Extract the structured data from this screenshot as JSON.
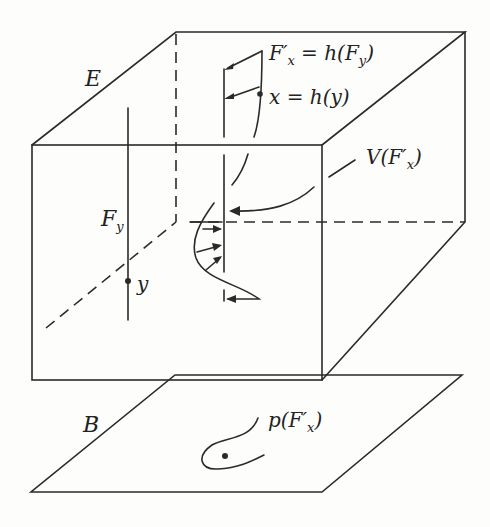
{
  "diagram": {
    "labels": {
      "total_space": "E",
      "base_space": "B",
      "fiber_y": "F",
      "fiber_y_sub": "y",
      "point_y": "y",
      "fiber_x_eq": "F′",
      "fiber_x_sub": "x",
      "fiber_x_rhs": " = h(F",
      "fiber_x_rhs_sub": "y",
      "fiber_x_rhs_close": ")",
      "point_x": "x = h(y)",
      "neighborhood": "V(F′",
      "neighborhood_sub": "x",
      "neighborhood_close": ")",
      "projection": "p(F′",
      "projection_sub": "x",
      "projection_close": ")"
    },
    "colors": {
      "line": "#2a2a2a",
      "background": "#fdfdfc"
    }
  }
}
